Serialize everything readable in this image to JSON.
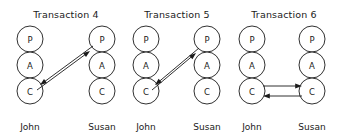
{
  "figure": {
    "width": 340,
    "height": 138,
    "background_color": "#ffffff",
    "stroke_color": "#1a1a1a",
    "node_radius": 13,
    "node_spacing_y": 26
  },
  "panels": [
    {
      "id": "transaction-4",
      "title": "Transaction  4",
      "title_x": 66,
      "title_y": 14,
      "columns": [
        {
          "id": "john",
          "actor_label": "John",
          "center_x": 30,
          "actor_label_y": 127,
          "nodes": [
            {
              "label": "P",
              "cy": 39
            },
            {
              "label": "A",
              "cy": 65
            },
            {
              "label": "C",
              "cy": 91
            }
          ]
        },
        {
          "id": "susan",
          "actor_label": "Susan",
          "center_x": 102,
          "actor_label_y": 127,
          "nodes": [
            {
              "label": "P",
              "cy": 39
            },
            {
              "label": "A",
              "cy": 65
            },
            {
              "label": "C",
              "cy": 91
            }
          ]
        }
      ],
      "arrows": [
        {
          "id": "susan-p-to-john-c",
          "from": "susan-p",
          "to": "john-c",
          "x1": 93,
          "y1": 46,
          "x2": 40,
          "y2": 85,
          "direction": "down-left"
        },
        {
          "id": "john-c-to-susan-p",
          "from": "john-c",
          "to": "susan-p",
          "x1": 37,
          "y1": 90,
          "x2": 90,
          "y2": 51,
          "direction": "up-right"
        }
      ]
    },
    {
      "id": "transaction-5",
      "title": "Transaction  5",
      "title_x": 177,
      "title_y": 14,
      "columns": [
        {
          "id": "john",
          "actor_label": "John",
          "center_x": 146,
          "actor_label_y": 127,
          "nodes": [
            {
              "label": "P",
              "cy": 39
            },
            {
              "label": "A",
              "cy": 65
            },
            {
              "label": "C",
              "cy": 91
            }
          ]
        },
        {
          "id": "susan",
          "actor_label": "Susan",
          "center_x": 207,
          "actor_label_y": 127,
          "nodes": [
            {
              "label": "P",
              "cy": 39
            },
            {
              "label": "A",
              "cy": 65
            },
            {
              "label": "C",
              "cy": 91
            }
          ]
        }
      ],
      "arrows": [
        {
          "id": "susan-p-to-john-c",
          "from": "susan-p",
          "to": "john-c",
          "x1": 199,
          "y1": 48,
          "x2": 155,
          "y2": 85,
          "direction": "down-left"
        },
        {
          "id": "john-c-to-susan-p",
          "from": "john-c",
          "to": "susan-p",
          "x1": 152,
          "y1": 90,
          "x2": 196,
          "y2": 53,
          "direction": "up-right"
        }
      ]
    },
    {
      "id": "transaction-6",
      "title": "Transaction  6",
      "title_x": 284,
      "title_y": 14,
      "columns": [
        {
          "id": "john",
          "actor_label": "John",
          "center_x": 252,
          "actor_label_y": 127,
          "nodes": [
            {
              "label": "P",
              "cy": 39
            },
            {
              "label": "A",
              "cy": 65
            },
            {
              "label": "C",
              "cy": 91
            }
          ]
        },
        {
          "id": "susan",
          "actor_label": "Susan",
          "center_x": 312,
          "actor_label_y": 127,
          "nodes": [
            {
              "label": "P",
              "cy": 39
            },
            {
              "label": "A",
              "cy": 65
            },
            {
              "label": "C",
              "cy": 91
            }
          ]
        }
      ],
      "arrows": [
        {
          "id": "john-c-to-susan-c",
          "from": "john-c",
          "to": "susan-c",
          "x1": 263,
          "y1": 86,
          "x2": 302,
          "y2": 86,
          "direction": "right"
        },
        {
          "id": "susan-c-to-john-c",
          "from": "susan-c",
          "to": "john-c",
          "x1": 302,
          "y1": 96,
          "x2": 263,
          "y2": 96,
          "direction": "left"
        }
      ]
    }
  ]
}
